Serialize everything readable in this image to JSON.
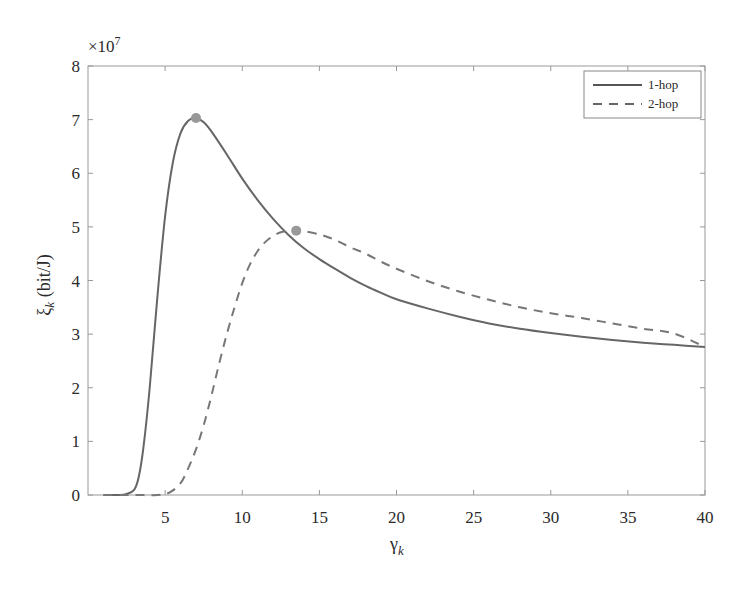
{
  "chart_data": {
    "type": "line",
    "title": "",
    "xlabel": "γ",
    "xlabel_sub": "k",
    "ylabel": "ξ",
    "ylabel_sub": "k",
    "ylabel_unit": " (bit/J)",
    "y_multiplier": "×10",
    "y_multiplier_exp": "7",
    "xlim": [
      0,
      40
    ],
    "ylim": [
      0,
      8
    ],
    "xticks": [
      5,
      10,
      15,
      20,
      25,
      30,
      35,
      40
    ],
    "yticks": [
      0,
      1,
      2,
      3,
      4,
      5,
      6,
      7,
      8
    ],
    "grid": false,
    "legend_position": "upper right",
    "series": [
      {
        "name": "1-hop",
        "style": "solid",
        "color": "#666666",
        "x": [
          1,
          2,
          2.5,
          3,
          3.3,
          3.6,
          4,
          4.5,
          5,
          5.5,
          6,
          6.5,
          7,
          7.5,
          8,
          9,
          10,
          11,
          12,
          13,
          14,
          15,
          16,
          17,
          18,
          19,
          20,
          22,
          24,
          26,
          28,
          30,
          32,
          34,
          36,
          38,
          40
        ],
        "values": [
          0,
          0,
          0.02,
          0.1,
          0.35,
          0.9,
          2.0,
          3.7,
          5.2,
          6.2,
          6.75,
          6.98,
          7.03,
          6.95,
          6.78,
          6.35,
          5.9,
          5.5,
          5.15,
          4.85,
          4.6,
          4.4,
          4.22,
          4.05,
          3.9,
          3.77,
          3.65,
          3.48,
          3.33,
          3.2,
          3.1,
          3.02,
          2.95,
          2.89,
          2.84,
          2.8,
          2.76
        ],
        "marker": {
          "x": 7.0,
          "y": 7.03
        }
      },
      {
        "name": "2-hop",
        "style": "dashed",
        "color": "#777777",
        "x": [
          1,
          3,
          4.5,
          5.3,
          6,
          6.5,
          7,
          7.5,
          8,
          8.5,
          9,
          9.5,
          10,
          10.5,
          11,
          11.5,
          12,
          12.5,
          13,
          13.5,
          14,
          15,
          16,
          17,
          18,
          19,
          20,
          22,
          24,
          26,
          28,
          30,
          32,
          34,
          36,
          38,
          40
        ],
        "values": [
          0,
          0,
          0,
          0.05,
          0.22,
          0.5,
          0.85,
          1.3,
          1.85,
          2.45,
          3.0,
          3.5,
          3.95,
          4.3,
          4.55,
          4.72,
          4.83,
          4.9,
          4.93,
          4.93,
          4.92,
          4.86,
          4.76,
          4.62,
          4.5,
          4.35,
          4.22,
          3.99,
          3.8,
          3.64,
          3.5,
          3.39,
          3.3,
          3.2,
          3.1,
          3.01,
          2.76
        ],
        "marker": {
          "x": 13.5,
          "y": 4.93
        }
      }
    ]
  },
  "legend": {
    "items": [
      {
        "label": "1-hop"
      },
      {
        "label": "2-hop"
      }
    ]
  }
}
